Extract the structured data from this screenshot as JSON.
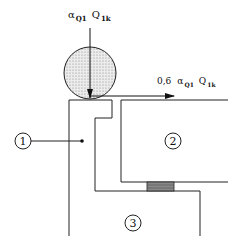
{
  "diagram": {
    "vertical_load": {
      "symbol": "α",
      "sub1": "Q1",
      "symbol2": "Q",
      "sub2": "1k"
    },
    "horizontal_load": {
      "factor": "0,6",
      "symbol": "α",
      "sub1": "Q1",
      "symbol2": "Q",
      "sub2": "1k"
    },
    "markers": [
      {
        "id": "1",
        "label": "1"
      },
      {
        "id": "2",
        "label": "2"
      },
      {
        "id": "3",
        "label": "3"
      }
    ],
    "colors": {
      "line": "#222222",
      "wheel_fill": "#d8d8d8",
      "bearing_fill": "#888888"
    }
  }
}
